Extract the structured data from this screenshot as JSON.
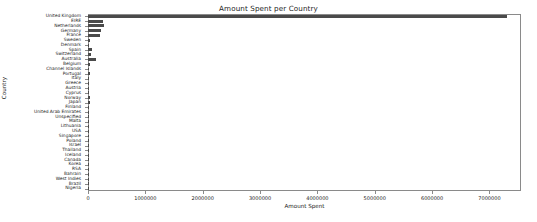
{
  "chart_data": {
    "type": "bar",
    "orientation": "horizontal",
    "title": "Amount Spent per Country",
    "xlabel": "Amount Spent",
    "ylabel": "Country",
    "xlim": [
      0,
      7550000
    ],
    "ylim": null,
    "grid": false,
    "legend": null,
    "bar_color": "#4a4a4a",
    "xticks": [
      0,
      1000000,
      2000000,
      3000000,
      4000000,
      5000000,
      6000000,
      7000000
    ],
    "xticklabels": [
      "0",
      "1000000",
      "2000000",
      "3000000",
      "4000000",
      "5000000",
      "6000000",
      "7000000"
    ],
    "categories": [
      "United Kingdom",
      "EIRE",
      "Netherlands",
      "Germany",
      "France",
      "Sweden",
      "Denmark",
      "Spain",
      "Switzerland",
      "Australia",
      "Belgium",
      "Channel Islands",
      "Portugal",
      "Italy",
      "Greece",
      "Austria",
      "Cyprus",
      "Norway",
      "Japan",
      "Finland",
      "United Arab Emirates",
      "Unspecified",
      "Malta",
      "Lithuania",
      "USA",
      "Singapore",
      "Poland",
      "Israel",
      "Thailand",
      "Iceland",
      "Canada",
      "Korea",
      "RSA",
      "Bahrain",
      "West Indies",
      "Brazil",
      "Nigeria"
    ],
    "values": [
      7308392,
      265545,
      285446,
      228867,
      209024,
      38378,
      18768,
      61577,
      56443,
      138521,
      41196,
      20450,
      33440,
      17483,
      4760,
      10199,
      13590,
      35163,
      37416,
      22546,
      1902,
      4750,
      2726,
      1661,
      3580,
      9120,
      7334,
      7908,
      2833,
      4310,
      3666,
      1509,
      1002,
      548,
      376,
      1144,
      1002
    ]
  }
}
